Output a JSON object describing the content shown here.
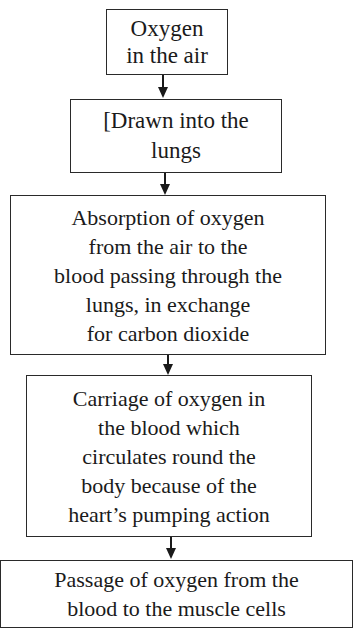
{
  "flowchart": {
    "steps": [
      {
        "lines": [
          "Oxygen",
          "in the air"
        ]
      },
      {
        "lines": [
          "[Drawn into the",
          "lungs"
        ]
      },
      {
        "lines": [
          "Absorption of oxygen",
          "from the air to the",
          "blood passing through the",
          "lungs, in exchange",
          "for carbon dioxide"
        ]
      },
      {
        "lines": [
          "Carriage of oxygen in",
          "the blood which",
          "circulates round the",
          "body because of the",
          "heart’s pumping action"
        ]
      },
      {
        "lines": [
          "Passage of oxygen from the",
          "blood to the muscle cells"
        ]
      }
    ],
    "arrow_icon": "down-arrow-icon"
  }
}
